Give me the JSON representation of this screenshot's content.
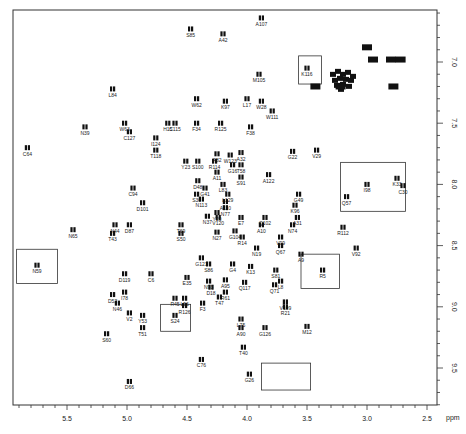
{
  "chart_data": {
    "type": "scatter",
    "title": "",
    "xlabel": "ppm",
    "ylabel": "ppm",
    "xlim": [
      5.95,
      2.42
    ],
    "ylim": [
      6.6,
      9.8
    ],
    "x_ticks": [
      "5.5",
      "5.0",
      "4.5",
      "4.0",
      "3.5",
      "3.0",
      "2.5"
    ],
    "y_ticks": [
      "7.0",
      "7.5",
      "8.0",
      "8.5",
      "9.0",
      "9.5"
    ],
    "grid": false,
    "legend": null,
    "points": [
      {
        "label": "S85",
        "x": 4.47,
        "y": 6.73
      },
      {
        "label": "A42",
        "x": 4.2,
        "y": 6.77
      },
      {
        "label": "A107",
        "x": 3.88,
        "y": 6.64
      },
      {
        "label": "K116",
        "x": 3.5,
        "y": 7.05
      },
      {
        "label": "M105",
        "x": 3.9,
        "y": 7.1
      },
      {
        "label": "L84",
        "x": 5.12,
        "y": 7.22
      },
      {
        "label": "W62",
        "x": 4.42,
        "y": 7.3
      },
      {
        "label": "K97",
        "x": 4.18,
        "y": 7.32
      },
      {
        "label": "L17",
        "x": 4.0,
        "y": 7.3
      },
      {
        "label": "W28",
        "x": 3.88,
        "y": 7.32
      },
      {
        "label": "W111",
        "x": 3.79,
        "y": 7.4
      },
      {
        "label": "H15",
        "x": 4.66,
        "y": 7.5
      },
      {
        "label": "C115",
        "x": 4.6,
        "y": 7.5
      },
      {
        "label": "F34",
        "x": 4.42,
        "y": 7.5
      },
      {
        "label": "R125",
        "x": 4.22,
        "y": 7.5
      },
      {
        "label": "F38",
        "x": 3.97,
        "y": 7.53
      },
      {
        "label": "N39",
        "x": 5.35,
        "y": 7.53
      },
      {
        "label": "W63",
        "x": 5.02,
        "y": 7.5
      },
      {
        "label": "C127",
        "x": 4.98,
        "y": 7.57
      },
      {
        "label": "C64",
        "x": 5.83,
        "y": 7.7
      },
      {
        "label": "I124",
        "x": 4.76,
        "y": 7.62
      },
      {
        "label": "T118",
        "x": 4.76,
        "y": 7.72
      },
      {
        "label": "A82",
        "x": 4.25,
        "y": 7.75
      },
      {
        "label": "W123",
        "x": 4.14,
        "y": 7.76
      },
      {
        "label": "A32",
        "x": 4.05,
        "y": 7.74
      },
      {
        "label": "Y23",
        "x": 4.51,
        "y": 7.81
      },
      {
        "label": "S100",
        "x": 4.41,
        "y": 7.81
      },
      {
        "label": "R114",
        "x": 4.27,
        "y": 7.81
      },
      {
        "label": "G16",
        "x": 4.12,
        "y": 7.84
      },
      {
        "label": "T58",
        "x": 4.05,
        "y": 7.84
      },
      {
        "label": "G22",
        "x": 3.62,
        "y": 7.73
      },
      {
        "label": "V29",
        "x": 3.42,
        "y": 7.72
      },
      {
        "label": "A122",
        "x": 3.82,
        "y": 7.92
      },
      {
        "label": "A11",
        "x": 4.25,
        "y": 7.9
      },
      {
        "label": "S91",
        "x": 4.05,
        "y": 7.94
      },
      {
        "label": "L83",
        "x": 4.2,
        "y": 8.0
      },
      {
        "label": "D48",
        "x": 4.41,
        "y": 7.97
      },
      {
        "label": "G41",
        "x": 4.35,
        "y": 8.03
      },
      {
        "label": "G49",
        "x": 3.57,
        "y": 8.08
      },
      {
        "label": "C94",
        "x": 4.95,
        "y": 8.03
      },
      {
        "label": "S36",
        "x": 4.42,
        "y": 8.08
      },
      {
        "label": "N113",
        "x": 4.38,
        "y": 8.12
      },
      {
        "label": "L129",
        "x": 4.16,
        "y": 8.08
      },
      {
        "label": "A110",
        "x": 4.18,
        "y": 8.14
      },
      {
        "label": "N77",
        "x": 4.18,
        "y": 8.19
      },
      {
        "label": "K96",
        "x": 3.6,
        "y": 8.17
      },
      {
        "label": "Q57",
        "x": 3.17,
        "y": 8.1
      },
      {
        "label": "D101",
        "x": 4.87,
        "y": 8.15
      },
      {
        "label": "D87",
        "x": 4.98,
        "y": 8.33
      },
      {
        "label": "N44",
        "x": 5.1,
        "y": 8.33
      },
      {
        "label": "N37",
        "x": 4.33,
        "y": 8.26
      },
      {
        "label": "Y20",
        "x": 4.25,
        "y": 8.23
      },
      {
        "label": "V120",
        "x": 4.24,
        "y": 8.27
      },
      {
        "label": "E7",
        "x": 4.05,
        "y": 8.27
      },
      {
        "label": "Q102",
        "x": 3.85,
        "y": 8.27
      },
      {
        "label": "A31",
        "x": 3.58,
        "y": 8.27
      },
      {
        "label": "A10",
        "x": 3.88,
        "y": 8.33
      },
      {
        "label": "N74",
        "x": 3.62,
        "y": 8.33
      },
      {
        "label": "T69",
        "x": 4.55,
        "y": 8.33
      },
      {
        "label": "S50",
        "x": 4.55,
        "y": 8.4
      },
      {
        "label": "N27",
        "x": 4.25,
        "y": 8.39
      },
      {
        "label": "G104",
        "x": 4.1,
        "y": 8.38
      },
      {
        "label": "R14",
        "x": 4.04,
        "y": 8.43
      },
      {
        "label": "V99",
        "x": 3.72,
        "y": 8.43
      },
      {
        "label": "R112",
        "x": 3.2,
        "y": 8.35
      },
      {
        "label": "N65",
        "x": 5.45,
        "y": 8.37
      },
      {
        "label": "T43",
        "x": 5.12,
        "y": 8.4
      },
      {
        "label": "I98",
        "x": 3.0,
        "y": 8.0
      },
      {
        "label": "K33",
        "x": 2.75,
        "y": 7.95
      },
      {
        "label": "C30",
        "x": 2.7,
        "y": 8.01
      },
      {
        "label": "N19",
        "x": 3.92,
        "y": 8.52
      },
      {
        "label": "Q67",
        "x": 3.72,
        "y": 8.5
      },
      {
        "label": "A9",
        "x": 3.55,
        "y": 8.57
      },
      {
        "label": "V92",
        "x": 3.09,
        "y": 8.52
      },
      {
        "label": "G121",
        "x": 4.38,
        "y": 8.6
      },
      {
        "label": "G4",
        "x": 4.12,
        "y": 8.65
      },
      {
        "label": "S86",
        "x": 4.32,
        "y": 8.65
      },
      {
        "label": "K13",
        "x": 3.97,
        "y": 8.67
      },
      {
        "label": "S81",
        "x": 3.76,
        "y": 8.7
      },
      {
        "label": "N59",
        "x": 5.75,
        "y": 8.66
      },
      {
        "label": "R5",
        "x": 3.37,
        "y": 8.7
      },
      {
        "label": "D119",
        "x": 5.02,
        "y": 8.73
      },
      {
        "label": "C6",
        "x": 4.8,
        "y": 8.73
      },
      {
        "label": "E35",
        "x": 4.5,
        "y": 8.76
      },
      {
        "label": "N93",
        "x": 4.32,
        "y": 8.79
      },
      {
        "label": "A95",
        "x": 4.18,
        "y": 8.78
      },
      {
        "label": "Q117",
        "x": 4.02,
        "y": 8.8
      },
      {
        "label": "L8",
        "x": 3.72,
        "y": 8.79
      },
      {
        "label": "D18",
        "x": 4.3,
        "y": 8.84
      },
      {
        "label": "Q71",
        "x": 3.77,
        "y": 8.82
      },
      {
        "label": "I78",
        "x": 5.02,
        "y": 8.88
      },
      {
        "label": "D52",
        "x": 5.12,
        "y": 8.9
      },
      {
        "label": "R61",
        "x": 4.18,
        "y": 8.88
      },
      {
        "label": "R45",
        "x": 4.6,
        "y": 8.93
      },
      {
        "label": "L56",
        "x": 4.52,
        "y": 8.93
      },
      {
        "label": "T47",
        "x": 4.23,
        "y": 8.92
      },
      {
        "label": "N46",
        "x": 5.08,
        "y": 8.97
      },
      {
        "label": "F3",
        "x": 4.37,
        "y": 8.97
      },
      {
        "label": "R126",
        "x": 4.52,
        "y": 8.99
      },
      {
        "label": "V109",
        "x": 3.68,
        "y": 8.96
      },
      {
        "label": "R21",
        "x": 3.68,
        "y": 9.0
      },
      {
        "label": "Y53",
        "x": 4.87,
        "y": 9.07
      },
      {
        "label": "V2",
        "x": 4.98,
        "y": 9.05
      },
      {
        "label": "S24",
        "x": 4.6,
        "y": 9.07
      },
      {
        "label": "L75",
        "x": 4.05,
        "y": 9.1
      },
      {
        "label": "A90",
        "x": 4.05,
        "y": 9.17
      },
      {
        "label": "G126",
        "x": 3.85,
        "y": 9.17
      },
      {
        "label": "M12",
        "x": 3.5,
        "y": 9.16
      },
      {
        "label": "T51",
        "x": 4.87,
        "y": 9.17
      },
      {
        "label": "S60",
        "x": 5.17,
        "y": 9.22
      },
      {
        "label": "T40",
        "x": 4.03,
        "y": 9.33
      },
      {
        "label": "C76",
        "x": 4.38,
        "y": 9.43
      },
      {
        "label": "G26",
        "x": 3.98,
        "y": 9.55
      },
      {
        "label": "D66",
        "x": 4.98,
        "y": 9.61
      }
    ],
    "boxes": [
      {
        "x1": 3.57,
        "x2": 3.38,
        "y1": 6.95,
        "y2": 7.18,
        "label": "K116"
      },
      {
        "x1": 3.22,
        "x2": 2.68,
        "y1": 7.82,
        "y2": 8.22,
        "label": "I98 K33 C30"
      },
      {
        "x1": 5.92,
        "x2": 5.58,
        "y1": 8.53,
        "y2": 8.81,
        "label": "N59"
      },
      {
        "x1": 3.55,
        "x2": 3.23,
        "y1": 8.57,
        "y2": 8.85,
        "label": "R5"
      },
      {
        "x1": 4.72,
        "x2": 4.47,
        "y1": 8.98,
        "y2": 9.2,
        "label": "S24"
      },
      {
        "x1": 3.88,
        "x2": 3.47,
        "y1": 9.46,
        "y2": 9.68,
        "label": "G26"
      }
    ],
    "dense_cluster": {
      "x": 3.2,
      "y": 7.15,
      "note": "unlabeled overlapping peaks"
    }
  }
}
